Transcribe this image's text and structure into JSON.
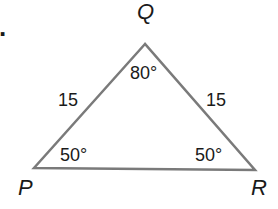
{
  "diagram": {
    "type": "triangle",
    "line_color": "#7a7a7a",
    "vertices": [
      {
        "name": "Q",
        "x": 145,
        "y": 44
      },
      {
        "name": "P",
        "x": 34,
        "y": 168
      },
      {
        "name": "R",
        "x": 255,
        "y": 170
      }
    ],
    "labels": {
      "bullet": ".",
      "vertex_q": "Q",
      "vertex_p": "P",
      "vertex_r": "R",
      "side_pq": "15",
      "side_qr": "15",
      "angle_q": "80°",
      "angle_p": "50°",
      "angle_r": "50°"
    }
  }
}
